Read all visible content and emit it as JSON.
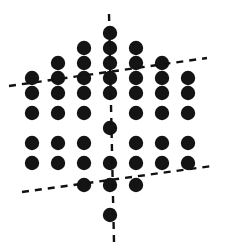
{
  "figure": {
    "width": 232,
    "height": 249,
    "background_color": "#ffffff",
    "dot_color": "#141414",
    "line_color": "#111111",
    "dot_radius": 7.2,
    "dot_count": 43,
    "line_count": 3
  },
  "chart_data": {
    "type": "scatter",
    "title": "",
    "subtitle": "",
    "xlabel": "",
    "ylabel": "",
    "grid": false,
    "legend": "none",
    "xlim": [
      0,
      232
    ],
    "ylim": [
      249,
      0
    ],
    "lattice": {
      "type": "triangular",
      "center": [
        110,
        128
      ],
      "column_spacing": 26.3,
      "row_spacing": 15.2,
      "rows": 13,
      "max_row_length": 7
    },
    "series": [
      {
        "name": "lattice-dots",
        "marker": "filled-circle",
        "color": "#141414",
        "size": 14.4,
        "points": [
          [
            110,
            33
          ],
          [
            84,
            48
          ],
          [
            110,
            48
          ],
          [
            136,
            48
          ],
          [
            58,
            63
          ],
          [
            84,
            63
          ],
          [
            110,
            63
          ],
          [
            136,
            63
          ],
          [
            162,
            63
          ],
          [
            32,
            78
          ],
          [
            58,
            78
          ],
          [
            84,
            78
          ],
          [
            110,
            78
          ],
          [
            136,
            78
          ],
          [
            162,
            78
          ],
          [
            188,
            78
          ],
          [
            32,
            93
          ],
          [
            58,
            93
          ],
          [
            84,
            93
          ],
          [
            110,
            93
          ],
          [
            136,
            93
          ],
          [
            162,
            93
          ],
          [
            188,
            93
          ],
          [
            32,
            113
          ],
          [
            58,
            113
          ],
          [
            84,
            113
          ],
          [
            136,
            113
          ],
          [
            162,
            113
          ],
          [
            188,
            113
          ],
          [
            110,
            128
          ],
          [
            32,
            143
          ],
          [
            58,
            143
          ],
          [
            84,
            143
          ],
          [
            136,
            143
          ],
          [
            162,
            143
          ],
          [
            188,
            143
          ],
          [
            32,
            163
          ],
          [
            58,
            163
          ],
          [
            84,
            163
          ],
          [
            110,
            163
          ],
          [
            136,
            163
          ],
          [
            162,
            163
          ],
          [
            188,
            163
          ],
          [
            84,
            185
          ],
          [
            110,
            185
          ],
          [
            136,
            185
          ],
          [
            110,
            215
          ]
        ]
      }
    ],
    "annotations": [
      {
        "name": "vertical-mirror-axis",
        "style": "dashed",
        "color": "#111111",
        "width": 2.4,
        "dash": "7,6",
        "x1": 109,
        "y1": 14,
        "x2": 114,
        "y2": 242
      },
      {
        "name": "ascending-mirror-axis",
        "style": "dashed",
        "color": "#111111",
        "width": 2.4,
        "dash": "7,6",
        "x1": 9,
        "y1": 86,
        "x2": 207,
        "y2": 58
      },
      {
        "name": "descending-mirror-axis",
        "style": "dashed",
        "color": "#111111",
        "width": 2.4,
        "dash": "7,6",
        "x1": 22,
        "y1": 192,
        "x2": 212,
        "y2": 166
      }
    ]
  }
}
